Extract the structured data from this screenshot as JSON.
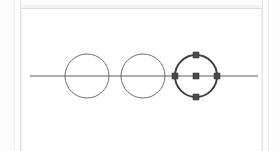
{
  "app": {
    "title": "Drawing Canvas",
    "background_color": "#fcfcfc",
    "canvas_color": "#ffffff",
    "panel_border_color": "#dcdcdc"
  },
  "canvas": {
    "name": "drawing-surface",
    "x": 21,
    "y": 8,
    "width": 241,
    "height": 143
  },
  "styles": {
    "shape_stroke_color": "#6f6f6f",
    "selected_stroke_color": "#3f3f3f",
    "line_stroke_color": "#5a5a5a",
    "handle_fill_color": "#4a4a4a",
    "shape_stroke_width": 1,
    "selected_stroke_width": 2,
    "line_stroke_width": 1
  },
  "shapes": [
    {
      "id": "circle-1",
      "name": "circle-shape-1",
      "type": "circle",
      "cx": 87,
      "cy": 76,
      "r": 22,
      "selected": false,
      "stroke": "#6f6f6f",
      "stroke_width": 1,
      "fill": "none"
    },
    {
      "id": "circle-2",
      "name": "circle-shape-2",
      "type": "circle",
      "cx": 143,
      "cy": 76,
      "r": 22,
      "selected": false,
      "stroke": "#6f6f6f",
      "stroke_width": 1,
      "fill": "none"
    },
    {
      "id": "circle-3",
      "name": "circle-shape-3-selected",
      "type": "circle",
      "cx": 196,
      "cy": 76,
      "r": 21,
      "selected": true,
      "stroke": "#3f3f3f",
      "stroke_width": 2,
      "fill": "none"
    },
    {
      "id": "line-1",
      "name": "horizontal-line",
      "type": "line",
      "x1": 30,
      "y1": 76,
      "x2": 258,
      "y2": 76,
      "selected": false,
      "stroke": "#5a5a5a",
      "stroke_width": 1
    }
  ],
  "selection": {
    "target_shape_id": "circle-3",
    "handle_size": 6,
    "handles": [
      {
        "name": "handle-top",
        "cx": 196,
        "cy": 55
      },
      {
        "name": "handle-bottom",
        "cx": 196,
        "cy": 97
      },
      {
        "name": "handle-left",
        "cx": 175,
        "cy": 76
      },
      {
        "name": "handle-right",
        "cx": 217,
        "cy": 76
      },
      {
        "name": "handle-center",
        "cx": 196,
        "cy": 76
      }
    ]
  }
}
